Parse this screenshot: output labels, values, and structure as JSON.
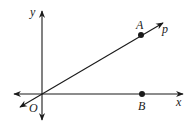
{
  "diagram": {
    "type": "coordinate-geometry",
    "colors": {
      "stroke": "#1a1a1a",
      "background": "#ffffff"
    },
    "axes": {
      "x_label": "x",
      "y_label": "y",
      "origin_label": "O"
    },
    "ray": {
      "label": "p"
    },
    "points": [
      {
        "label": "A",
        "on": "ray p"
      },
      {
        "label": "B",
        "on": "x-axis"
      }
    ]
  }
}
